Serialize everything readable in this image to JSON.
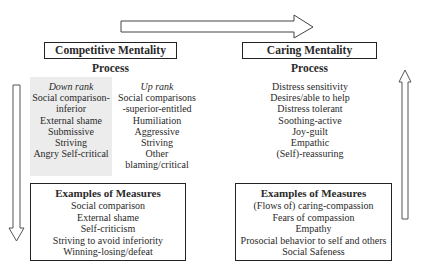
{
  "competitive": {
    "title": "Competitive Mentality",
    "process_heading": "Process",
    "down_rank": {
      "label": "Down rank",
      "items": [
        "Social comparison-",
        "inferior",
        "External shame",
        "Submissive",
        "Striving",
        "Angry Self-critical"
      ]
    },
    "up_rank": {
      "label": "Up rank",
      "items": [
        "Social comparisons",
        "-superior-entitled",
        "Humiliation",
        "Aggressive",
        "Striving",
        "Other",
        "blaming/critical"
      ]
    },
    "measures": {
      "heading": "Examples of Measures",
      "items": [
        "Social comparison",
        "External shame",
        "Self-criticism",
        "Striving to avoid inferiority",
        "Winning-losing/defeat"
      ]
    }
  },
  "caring": {
    "title": "Caring Mentality",
    "process_heading": "Process",
    "process_items": [
      "Distress sensitivity",
      "Desires/able to help",
      "Distress tolerant",
      "Soothing-active",
      "Joy-guilt",
      "Empathic",
      "(Self)-reassuring"
    ],
    "measures": {
      "heading": "Examples of Measures",
      "items": [
        "(Flows of) caring-compassion",
        "Fears of compassion",
        "Empathy",
        "Prosocial behavior to self and others",
        "Social Safeness"
      ]
    }
  },
  "arrows": {
    "top": "right-arrow",
    "left": "down-arrow",
    "right": "up-arrow"
  },
  "colors": {
    "line": "#222222",
    "arrow_outline": "#555555",
    "gray_panel": "#ececec"
  }
}
